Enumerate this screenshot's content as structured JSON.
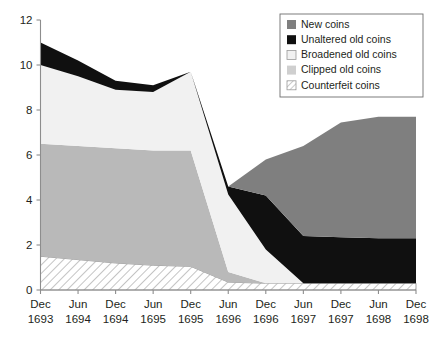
{
  "chart_data": {
    "type": "area",
    "stacked": true,
    "title": "",
    "subtitle": "",
    "xlabel": "",
    "ylabel": "",
    "ylim": [
      0,
      12
    ],
    "yticks": [
      0,
      2,
      4,
      6,
      8,
      10,
      12
    ],
    "ytick_labels": [
      "0",
      "2",
      "4",
      "6",
      "8",
      "10",
      "12"
    ],
    "grid": false,
    "legend_position": "top-right",
    "categories": [
      "Dec 1693",
      "Jun 1694",
      "Dec 1694",
      "Jun 1695",
      "Dec 1695",
      "Jun 1696",
      "Dec 1696",
      "Jun 1697",
      "Dec 1697",
      "Jun 1698",
      "Dec 1698"
    ],
    "category_lines": [
      [
        "Dec",
        "1693"
      ],
      [
        "Jun",
        "1694"
      ],
      [
        "Dec",
        "1694"
      ],
      [
        "Jun",
        "1695"
      ],
      [
        "Dec",
        "1695"
      ],
      [
        "Jun",
        "1696"
      ],
      [
        "Dec",
        "1696"
      ],
      [
        "Jun",
        "1697"
      ],
      [
        "Dec",
        "1697"
      ],
      [
        "Jun",
        "1698"
      ],
      [
        "Dec",
        "1698"
      ]
    ],
    "stack_order_bottom_to_top": [
      "Counterfeit coins",
      "Clipped old coins",
      "Broadened old coins",
      "Unaltered old coins",
      "New coins"
    ],
    "series": [
      {
        "name": "Counterfeit coins",
        "color": "#ffffff",
        "pattern": "diagonal-hatch",
        "values": [
          1.5,
          1.35,
          1.2,
          1.1,
          1.05,
          0.35,
          0.3,
          0.3,
          0.3,
          0.3,
          0.3
        ]
      },
      {
        "name": "Clipped old coins",
        "color": "#b9b9b9",
        "pattern": "solid",
        "values": [
          5.0,
          5.05,
          5.1,
          5.1,
          5.15,
          0.45,
          0.0,
          0.0,
          0.0,
          0.0,
          0.0
        ]
      },
      {
        "name": "Broadened old coins",
        "color": "#f1f1f1",
        "pattern": "solid",
        "values": [
          3.5,
          3.1,
          2.6,
          2.6,
          3.5,
          3.45,
          1.5,
          0.0,
          0.0,
          0.0,
          0.0
        ]
      },
      {
        "name": "Unaltered old coins",
        "color": "#101010",
        "pattern": "solid",
        "values": [
          1.0,
          0.7,
          0.4,
          0.3,
          0.0,
          0.35,
          2.4,
          2.1,
          2.05,
          2.0,
          2.0
        ]
      },
      {
        "name": "New coins",
        "color": "#7f7f7f",
        "pattern": "solid",
        "values": [
          0.0,
          0.0,
          0.0,
          0.0,
          0.0,
          0.0,
          1.6,
          4.0,
          5.1,
          5.4,
          5.4
        ]
      }
    ],
    "cumulative_tops": {
      "Counterfeit coins": [
        1.5,
        1.35,
        1.2,
        1.1,
        1.05,
        0.35,
        0.3,
        0.3,
        0.3,
        0.3,
        0.3
      ],
      "Clipped old coins": [
        6.5,
        6.4,
        6.3,
        6.2,
        6.2,
        0.8,
        0.3,
        0.3,
        0.3,
        0.3,
        0.3
      ],
      "Broadened old coins": [
        10.0,
        9.5,
        8.9,
        8.8,
        9.7,
        4.25,
        1.8,
        0.3,
        0.3,
        0.3,
        0.3
      ],
      "Unaltered old coins": [
        11.0,
        10.2,
        9.3,
        9.1,
        9.7,
        4.6,
        4.2,
        2.4,
        2.35,
        2.3,
        2.3
      ],
      "New coins": [
        11.0,
        10.2,
        9.3,
        9.1,
        9.7,
        4.6,
        5.8,
        6.4,
        7.45,
        7.7,
        7.7
      ]
    },
    "legend": [
      {
        "label": "New coins",
        "swatch": "solid",
        "color": "#7f7f7f"
      },
      {
        "label": "Unaltered old coins",
        "swatch": "solid",
        "color": "#101010"
      },
      {
        "label": "Broadened old coins",
        "swatch": "solid",
        "color": "#f1f1f1"
      },
      {
        "label": "Clipped old coins",
        "swatch": "solid",
        "color": "#cfcfcf"
      },
      {
        "label": "Counterfeit coins",
        "swatch": "hatch",
        "color": "#ffffff"
      }
    ]
  }
}
